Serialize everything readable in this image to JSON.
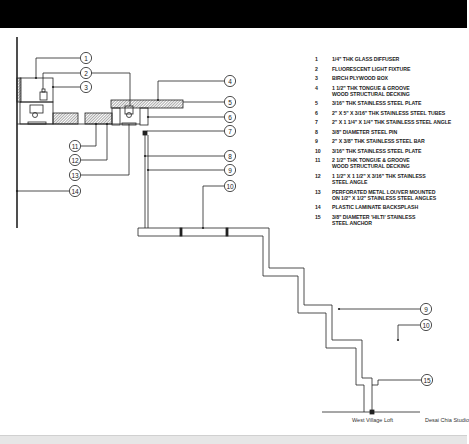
{
  "drawing": {
    "project": "West Village Loft",
    "studio": "Desai Chia Studio",
    "colors": {
      "ink": "#222222",
      "hatch": "#555555",
      "band_top": "#000000",
      "band_bottom": "#e6e6e6"
    }
  },
  "legend": [
    {
      "num": "1",
      "text": "1/4\" THK GLASS DIFFUSER"
    },
    {
      "num": "2",
      "text": "FLUORESCENT LIGHT FIXTURE"
    },
    {
      "num": "3",
      "text": "BIRCH PLYWOOD BOX"
    },
    {
      "num": "4",
      "text": "1 1/2\" THK TONGUE & GROOVE\nWOOD STRUCTURAL DECKING"
    },
    {
      "num": "5",
      "text": "3/16\" THK STAINLESS STEEL PLATE"
    },
    {
      "num": "6",
      "text": "2\" X 5\" X 3/16\" THK STAINLESS STEEL TUBES"
    },
    {
      "num": "7",
      "text": "2\" X 1 1/4\" X 1/4\" THK STAINLESS STEEL ANGLE"
    },
    {
      "num": "8",
      "text": "3/8\" DIAMETER STEEL PIN"
    },
    {
      "num": "9",
      "text": "2\" X 3/8\" THK STAINLESS STEEL BAR"
    },
    {
      "num": "10",
      "text": "3/16\" THK STAINLESS STEEL PLATE"
    },
    {
      "num": "11",
      "text": "2 1/2\" THK TONGUE & GROOVE\nWOOD STRUCTURAL DECKING"
    },
    {
      "num": "12",
      "text": "1 1/2\" X 1 1/2\" X 3/16\" THK STAINLESS\nSTEEL ANGLE"
    },
    {
      "num": "13",
      "text": "PERFORATED METAL LOUVER MOUNTED\nON 1/2\" X 1/2\" STAINLESS STEEL ANGLES"
    },
    {
      "num": "14",
      "text": "PLASTIC LAMINATE BACKSPLASH"
    },
    {
      "num": "15",
      "text": "3/8\" DIAMETER 'HILTI' STAINLESS\nSTEEL ANCHOR"
    }
  ],
  "callouts": [
    {
      "label": "1"
    },
    {
      "label": "2"
    },
    {
      "label": "3"
    },
    {
      "label": "4"
    },
    {
      "label": "5"
    },
    {
      "label": "6"
    },
    {
      "label": "7"
    },
    {
      "label": "8"
    },
    {
      "label": "9"
    },
    {
      "label": "10"
    },
    {
      "label": "11"
    },
    {
      "label": "12"
    },
    {
      "label": "13"
    },
    {
      "label": "14"
    },
    {
      "label": "9"
    },
    {
      "label": "10"
    },
    {
      "label": "15"
    }
  ]
}
